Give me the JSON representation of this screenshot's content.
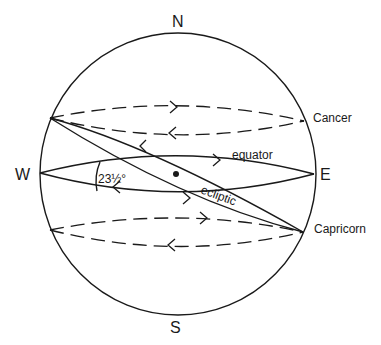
{
  "diagram": {
    "labels": {
      "north": "N",
      "south": "S",
      "west": "W",
      "east": "E",
      "cancer": "Cancer",
      "capricorn": "Capricorn",
      "equator": "equator",
      "ecliptic": "ecliptic",
      "angle": "23½°"
    },
    "angle_value": "23½",
    "elements": [
      "celestial-sphere-outline",
      "tropic-of-cancer-dashed-ellipse",
      "celestial-equator-ellipse",
      "ecliptic-ellipse",
      "tropic-of-capricorn-dashed-ellipse",
      "center-dot"
    ],
    "colors": {
      "stroke": "#1a1a1a",
      "background": "#ffffff"
    }
  }
}
